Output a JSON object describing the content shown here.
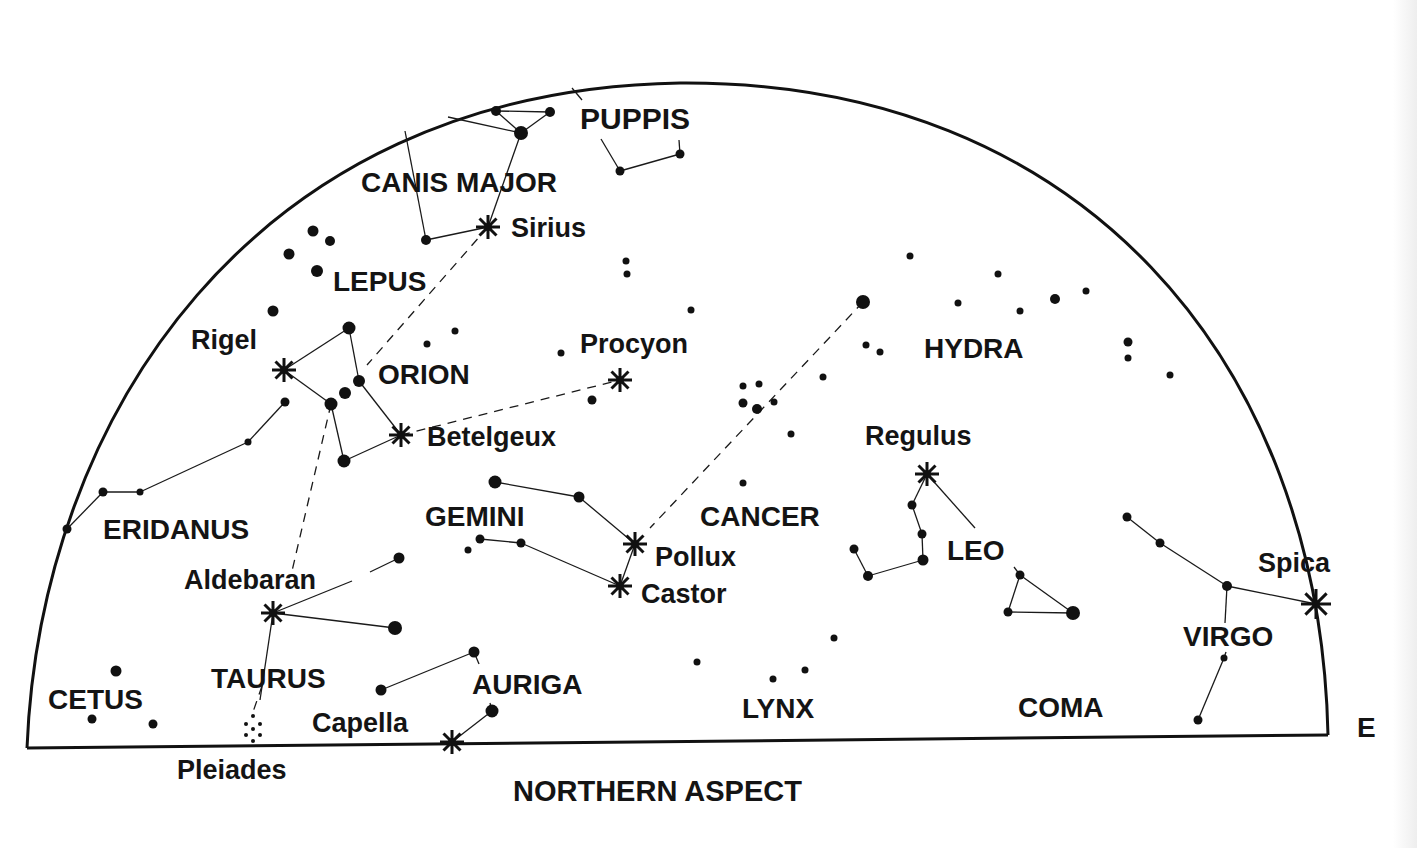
{
  "title": "NORTHERN ASPECT",
  "direction_label": "E",
  "colors": {
    "ink": "#111111",
    "background": "#ffffff"
  },
  "horizon": {
    "baseline": {
      "x1": 27,
      "y1": 748,
      "x2": 1328,
      "y2": 735
    },
    "arc_path": "M 27 748 C 40 420, 250 90, 680 83 C 1080 80, 1320 360, 1328 735"
  },
  "constellations": [
    {
      "name": "PUPPIS",
      "x": 580,
      "y": 129,
      "size": 30
    },
    {
      "name": "CANIS MAJOR",
      "x": 361,
      "y": 192,
      "size": 28
    },
    {
      "name": "LEPUS",
      "x": 333,
      "y": 291,
      "size": 28
    },
    {
      "name": "ORION",
      "x": 378,
      "y": 384,
      "size": 28
    },
    {
      "name": "ERIDANUS",
      "x": 103,
      "y": 539,
      "size": 28
    },
    {
      "name": "GEMINI",
      "x": 425,
      "y": 526,
      "size": 28
    },
    {
      "name": "CANCER",
      "x": 700,
      "y": 526,
      "size": 28
    },
    {
      "name": "HYDRA",
      "x": 924,
      "y": 358,
      "size": 28
    },
    {
      "name": "LEO",
      "x": 947,
      "y": 560,
      "size": 28
    },
    {
      "name": "VIRGO",
      "x": 1183,
      "y": 646,
      "size": 28
    },
    {
      "name": "TAURUS",
      "x": 211,
      "y": 688,
      "size": 28
    },
    {
      "name": "AURIGA",
      "x": 472,
      "y": 694,
      "size": 28
    },
    {
      "name": "CETUS",
      "x": 48,
      "y": 709,
      "size": 28
    },
    {
      "name": "LYNX",
      "x": 742,
      "y": 718,
      "size": 28
    },
    {
      "name": "COMA",
      "x": 1018,
      "y": 717,
      "size": 28
    }
  ],
  "named_stars": [
    {
      "name": "Sirius",
      "label_x": 511,
      "label_y": 237,
      "x": 488,
      "y": 227
    },
    {
      "name": "Rigel",
      "label_x": 191,
      "label_y": 349,
      "x": 284,
      "y": 370
    },
    {
      "name": "Procyon",
      "label_x": 580,
      "label_y": 353,
      "x": 620,
      "y": 380
    },
    {
      "name": "Betelgeux",
      "label_x": 427,
      "label_y": 446,
      "x": 401,
      "y": 435
    },
    {
      "name": "Regulus",
      "label_x": 865,
      "label_y": 445,
      "x": 927,
      "y": 474
    },
    {
      "name": "Pollux",
      "label_x": 655,
      "label_y": 566,
      "x": 635,
      "y": 544
    },
    {
      "name": "Castor",
      "label_x": 641,
      "label_y": 603,
      "x": 620,
      "y": 586
    },
    {
      "name": "Spica",
      "label_x": 1258,
      "label_y": 572,
      "x": 1316,
      "y": 604
    },
    {
      "name": "Aldebaran",
      "label_x": 184,
      "label_y": 589,
      "x": 273,
      "y": 613
    },
    {
      "name": "Capella",
      "label_x": 312,
      "label_y": 732,
      "x": 452,
      "y": 742
    },
    {
      "name": "Pleiades",
      "label_x": 177,
      "label_y": 779,
      "x": 253,
      "y": 732
    }
  ],
  "stars": [
    [
      496,
      111,
      5
    ],
    [
      550,
      112,
      5
    ],
    [
      521,
      133,
      7
    ],
    [
      680,
      154,
      4.5
    ],
    [
      620,
      171,
      4.5
    ],
    [
      426,
      240,
      5
    ],
    [
      313,
      231,
      5.5
    ],
    [
      330,
      241,
      5
    ],
    [
      289,
      254,
      5.5
    ],
    [
      317,
      271,
      6
    ],
    [
      273,
      311,
      5.5
    ],
    [
      349,
      328,
      6.5
    ],
    [
      359,
      381,
      6
    ],
    [
      345,
      393,
      6
    ],
    [
      331,
      404,
      6.5
    ],
    [
      344,
      461,
      6.5
    ],
    [
      285,
      402,
      4.5
    ],
    [
      248,
      442,
      3.5
    ],
    [
      140,
      492,
      3.5
    ],
    [
      103,
      492,
      4.5
    ],
    [
      67,
      529,
      4.5
    ],
    [
      427,
      344,
      3.5
    ],
    [
      455,
      331,
      3.5
    ],
    [
      561,
      353,
      3.5
    ],
    [
      592,
      400,
      4.5
    ],
    [
      626,
      261,
      3.5
    ],
    [
      627,
      274,
      3.5
    ],
    [
      691,
      310,
      3.5
    ],
    [
      743,
      386,
      3.5
    ],
    [
      759,
      384,
      3.5
    ],
    [
      743,
      403,
      4.5
    ],
    [
      757,
      409,
      5
    ],
    [
      774,
      402,
      3.5
    ],
    [
      823,
      377,
      3.5
    ],
    [
      791,
      434,
      3.5
    ],
    [
      743,
      483,
      3.5
    ],
    [
      863,
      302,
      7
    ],
    [
      866,
      345,
      3.5
    ],
    [
      880,
      352,
      3.5
    ],
    [
      910,
      256,
      3.5
    ],
    [
      998,
      274,
      3.5
    ],
    [
      958,
      303,
      3.5
    ],
    [
      1020,
      311,
      3.5
    ],
    [
      1055,
      299,
      5
    ],
    [
      1086,
      291,
      3.5
    ],
    [
      1128,
      342,
      4.5
    ],
    [
      1128,
      358,
      3.5
    ],
    [
      1170,
      375,
      3.5
    ],
    [
      495,
      482,
      6.5
    ],
    [
      579,
      497,
      5.5
    ],
    [
      480,
      539,
      4.5
    ],
    [
      521,
      543,
      4.5
    ],
    [
      468,
      550,
      3.5
    ],
    [
      912,
      505,
      4.5
    ],
    [
      922,
      534,
      4.5
    ],
    [
      923,
      560,
      5.5
    ],
    [
      868,
      576,
      5
    ],
    [
      854,
      549,
      4.5
    ],
    [
      1020,
      575,
      4.5
    ],
    [
      1008,
      612,
      4.5
    ],
    [
      1073,
      613,
      7
    ],
    [
      1127,
      517,
      4.5
    ],
    [
      1160,
      543,
      4.5
    ],
    [
      1227,
      586,
      5
    ],
    [
      1224,
      658,
      3.5
    ],
    [
      1198,
      720,
      4.5
    ],
    [
      399,
      558,
      5.5
    ],
    [
      395,
      628,
      7
    ],
    [
      381,
      690,
      5.5
    ],
    [
      474,
      652,
      5.5
    ],
    [
      492,
      711,
      6.5
    ],
    [
      697,
      662,
      3.5
    ],
    [
      773,
      679,
      3.5
    ],
    [
      805,
      670,
      3.5
    ],
    [
      834,
      638,
      3.5
    ],
    [
      116,
      671,
      5.5
    ],
    [
      92,
      719,
      4.5
    ],
    [
      153,
      724,
      4.5
    ]
  ],
  "pleiades_dots": [
    [
      253,
      716
    ],
    [
      246,
      724
    ],
    [
      260,
      724
    ],
    [
      253,
      729
    ],
    [
      246,
      735
    ],
    [
      260,
      735
    ],
    [
      253,
      741
    ]
  ],
  "lines": [
    [
      496,
      111,
      550,
      112
    ],
    [
      496,
      111,
      521,
      133
    ],
    [
      550,
      112,
      521,
      133
    ],
    [
      448,
      117,
      521,
      133
    ],
    [
      521,
      133,
      488,
      227
    ],
    [
      426,
      240,
      488,
      227
    ],
    [
      426,
      240,
      405,
      131
    ],
    [
      572,
      88,
      582,
      100
    ],
    [
      620,
      171,
      680,
      154
    ],
    [
      620,
      171,
      601,
      139
    ],
    [
      680,
      154,
      679,
      140
    ],
    [
      284,
      370,
      349,
      328
    ],
    [
      349,
      328,
      359,
      381
    ],
    [
      284,
      370,
      331,
      404
    ],
    [
      331,
      404,
      344,
      461
    ],
    [
      359,
      381,
      401,
      435
    ],
    [
      344,
      461,
      401,
      435
    ],
    [
      285,
      402,
      248,
      442
    ],
    [
      248,
      442,
      140,
      492
    ],
    [
      140,
      492,
      103,
      492
    ],
    [
      103,
      492,
      67,
      529
    ],
    [
      495,
      482,
      579,
      497
    ],
    [
      579,
      497,
      635,
      544
    ],
    [
      635,
      544,
      620,
      586
    ],
    [
      480,
      539,
      521,
      543
    ],
    [
      521,
      543,
      620,
      586
    ],
    [
      927,
      474,
      912,
      505
    ],
    [
      912,
      505,
      922,
      534
    ],
    [
      922,
      534,
      923,
      560
    ],
    [
      923,
      560,
      868,
      576
    ],
    [
      868,
      576,
      854,
      549
    ],
    [
      927,
      474,
      975,
      528
    ],
    [
      1020,
      575,
      1008,
      612
    ],
    [
      1008,
      612,
      1073,
      613
    ],
    [
      1020,
      575,
      1073,
      613
    ],
    [
      1020,
      575,
      1014,
      567
    ],
    [
      1127,
      517,
      1160,
      543
    ],
    [
      1160,
      543,
      1227,
      586
    ],
    [
      1227,
      586,
      1316,
      604
    ],
    [
      1227,
      586,
      1225,
      623
    ],
    [
      1224,
      658,
      1198,
      720
    ],
    [
      1224,
      658,
      1226,
      652
    ],
    [
      273,
      613,
      352,
      581
    ],
    [
      370,
      572,
      399,
      558
    ],
    [
      273,
      613,
      395,
      628
    ],
    [
      273,
      613,
      260,
      700
    ],
    [
      381,
      690,
      474,
      652
    ],
    [
      474,
      652,
      479,
      664
    ],
    [
      452,
      742,
      492,
      711
    ],
    [
      492,
      711,
      490,
      703
    ]
  ],
  "dashed_lines": [
    [
      488,
      227,
      367,
      365
    ],
    [
      401,
      435,
      620,
      380
    ],
    [
      331,
      404,
      292,
      571
    ],
    [
      863,
      302,
      650,
      528
    ],
    [
      262,
      686,
      253,
      712
    ]
  ]
}
